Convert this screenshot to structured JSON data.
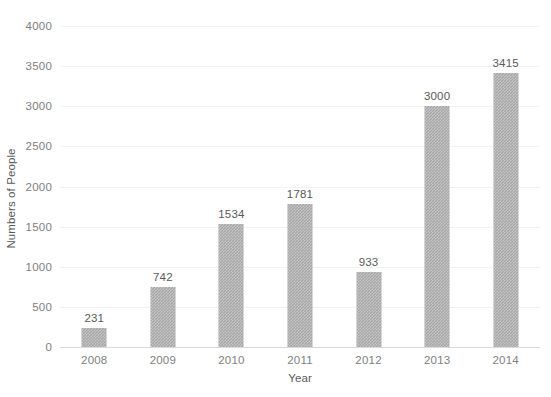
{
  "chart_data": {
    "type": "bar",
    "title": "",
    "xlabel": "Year",
    "ylabel": "Numbers of People",
    "categories": [
      "2008",
      "2009",
      "2010",
      "2011",
      "2012",
      "2013",
      "2014"
    ],
    "values": [
      231,
      742,
      1534,
      1781,
      933,
      3000,
      3415
    ],
    "data_labels": [
      "231",
      "742",
      "1534",
      "1781",
      "933",
      "3000",
      "3415"
    ],
    "ylim": [
      0,
      4000
    ],
    "ytick_labels": [
      "0",
      "500",
      "1000",
      "1500",
      "2000",
      "2500",
      "3000",
      "3500",
      "4000"
    ],
    "ytick_values": [
      0,
      500,
      1000,
      1500,
      2000,
      2500,
      3000,
      3500,
      4000
    ],
    "grid": "horizontal",
    "legend": "none",
    "bar_color": "#a6a6a6",
    "grid_color": "#f2f2f2",
    "axis_color": "#d9d9d9",
    "label_color": "#595959",
    "tick_color": "#808080"
  }
}
